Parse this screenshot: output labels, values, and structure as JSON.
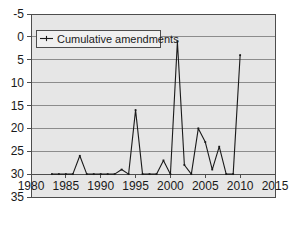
{
  "chart_data": {
    "type": "line",
    "title": "",
    "xlabel": "",
    "ylabel": "",
    "xlim": [
      1980,
      2015
    ],
    "ylim": [
      -5,
      35
    ],
    "xticks": [
      1980,
      1985,
      1990,
      1995,
      2000,
      2005,
      2010,
      2015
    ],
    "yticks": [
      -5,
      0,
      5,
      10,
      15,
      20,
      25,
      30,
      35
    ],
    "grid": "horizontal",
    "legend_position": "top-left",
    "legend": [
      "Cumulative amendments"
    ],
    "series": [
      {
        "name": "Cumulative amendments",
        "x": [
          1983,
          1984,
          1985,
          1986,
          1987,
          1988,
          1989,
          1990,
          1991,
          1992,
          1993,
          1994,
          1995,
          1996,
          1997,
          1998,
          1999,
          2000,
          2001,
          2002,
          2003,
          2004,
          2005,
          2006,
          2007,
          2008,
          2009,
          2010
        ],
        "values": [
          0,
          0,
          0,
          0,
          4,
          0,
          0,
          0,
          0,
          0,
          1,
          0,
          14,
          0,
          0,
          0,
          3,
          0,
          29,
          2,
          0,
          10,
          7,
          1,
          6,
          0,
          0,
          26
        ]
      }
    ]
  },
  "axis": {
    "y_labels": [
      "35",
      "30",
      "25",
      "20",
      "15",
      "10",
      "5",
      "0",
      "-5"
    ],
    "x_labels": [
      "1980",
      "1985",
      "1990",
      "1995",
      "2000",
      "2005",
      "2010",
      "2015"
    ]
  },
  "legend": {
    "label": "Cumulative amendments",
    "marker": "line-cross-marker"
  },
  "colors": {
    "plot_background": "#e6e6e6",
    "gridline": "#8c8c8c",
    "axis_line": "#4d4d4d",
    "series_line": "#1a1a1a",
    "text": "#1a1a1a",
    "legend_background": "#f0f0f0"
  }
}
